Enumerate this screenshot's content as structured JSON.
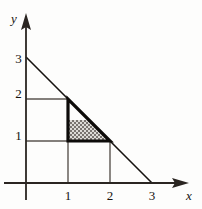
{
  "figure": {
    "kind": "cartesian-plot",
    "background_color": "#fdfdfc",
    "ink_color": "#15120f",
    "grid_color": "#4a4440",
    "shade_fill_color": "#d8d6d2",
    "shade_dot_color": "#55504c",
    "axes": {
      "x_label": "x",
      "y_label": "y",
      "x_ticks": [
        "1",
        "2",
        "3"
      ],
      "y_ticks": [
        "1",
        "2",
        "3"
      ],
      "origin_px": [
        26,
        183
      ],
      "unit_px": 42,
      "x_arrow": "arrow-right",
      "y_arrow": "arrow-up"
    },
    "elements": {
      "diagonal_line": {
        "equation": "x + y = 3",
        "from": [
          0,
          3
        ],
        "to": [
          3,
          0
        ]
      },
      "grid_segments": [
        {
          "name": "h-line-y1",
          "from": [
            0,
            1
          ],
          "to": [
            2,
            1
          ]
        },
        {
          "name": "h-line-y2",
          "from": [
            0,
            2
          ],
          "to": [
            1,
            2
          ]
        },
        {
          "name": "v-line-x1",
          "from": [
            1,
            0
          ],
          "to": [
            1,
            2
          ]
        },
        {
          "name": "v-line-x2",
          "from": [
            2,
            0
          ],
          "to": [
            2,
            1
          ]
        }
      ],
      "bold_triangle": {
        "vertices": [
          [
            1,
            2
          ],
          [
            1,
            1
          ],
          [
            2,
            1
          ]
        ],
        "stroke_width_px": 3
      },
      "shaded_region": {
        "shape": "trapezoid",
        "vertices": [
          [
            1,
            1
          ],
          [
            2,
            1
          ],
          [
            1.5,
            1.5
          ],
          [
            1,
            1.5
          ]
        ],
        "pattern": "stipple-dots"
      }
    }
  }
}
